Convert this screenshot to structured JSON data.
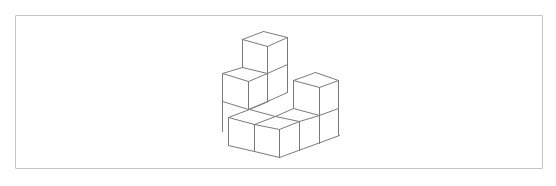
{
  "figure": {
    "type": "isometric-cube-stack",
    "frame": {
      "x": 15,
      "y": 15,
      "width": 528,
      "height": 154,
      "border_color": "#c4c4c4"
    },
    "line_color": "#7a7a7a",
    "segments": [
      [
        263,
        31,
        242,
        39
      ],
      [
        242,
        39,
        267,
        46
      ],
      [
        267,
        46,
        287,
        37
      ],
      [
        287,
        37,
        263,
        31
      ],
      [
        242,
        39,
        242,
        67
      ],
      [
        267,
        46,
        267,
        73
      ],
      [
        287,
        37,
        287,
        92
      ],
      [
        242,
        67,
        267,
        73
      ],
      [
        267,
        73,
        287,
        64
      ],
      [
        222,
        73,
        242,
        67
      ],
      [
        222,
        73,
        248,
        81
      ],
      [
        248,
        81,
        267,
        73
      ],
      [
        222,
        73,
        222,
        131
      ],
      [
        248,
        81,
        248,
        109
      ],
      [
        267,
        73,
        267,
        101
      ],
      [
        222,
        101,
        248,
        109
      ],
      [
        248,
        109,
        267,
        101
      ],
      [
        267,
        101,
        287,
        92
      ],
      [
        249,
        109,
        268,
        101
      ],
      [
        275,
        116,
        293,
        108
      ],
      [
        293,
        80,
        315,
        72
      ],
      [
        315,
        72,
        338,
        80
      ],
      [
        338,
        80,
        319,
        87
      ],
      [
        319,
        87,
        293,
        80
      ],
      [
        293,
        80,
        293,
        108
      ],
      [
        319,
        87,
        319,
        143
      ],
      [
        338,
        80,
        338,
        135
      ],
      [
        293,
        108,
        319,
        115
      ],
      [
        319,
        115,
        338,
        108
      ],
      [
        228,
        117,
        249,
        109
      ],
      [
        249,
        109,
        275,
        116
      ],
      [
        228,
        117,
        254,
        124
      ],
      [
        254,
        124,
        275,
        116
      ],
      [
        254,
        124,
        279,
        129
      ],
      [
        279,
        129,
        299,
        121
      ],
      [
        275,
        116,
        299,
        121
      ],
      [
        299,
        121,
        319,
        115
      ],
      [
        228,
        117,
        228,
        145
      ],
      [
        254,
        124,
        254,
        151
      ],
      [
        279,
        129,
        279,
        157
      ],
      [
        299,
        121,
        299,
        150
      ],
      [
        228,
        145,
        254,
        151
      ],
      [
        254,
        151,
        279,
        157
      ],
      [
        279,
        157,
        339,
        135
      ]
    ]
  }
}
